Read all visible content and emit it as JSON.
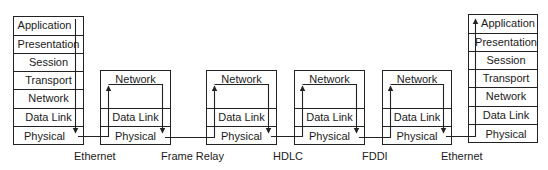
{
  "end_hosts": {
    "left": {
      "layers": [
        "Application",
        "Presentation",
        "Session",
        "Transport",
        "Network",
        "Data Link",
        "Physical"
      ]
    },
    "right": {
      "layers": [
        "Application",
        "Presentation",
        "Session",
        "Transport",
        "Network",
        "Data Link",
        "Physical"
      ]
    }
  },
  "routers": [
    {
      "layers": [
        "Network",
        "Data Link",
        "Physical"
      ]
    },
    {
      "layers": [
        "Network",
        "Data Link",
        "Physical"
      ]
    },
    {
      "layers": [
        "Network",
        "Data Link",
        "Physical"
      ]
    },
    {
      "layers": [
        "Network",
        "Data Link",
        "Physical"
      ]
    }
  ],
  "links": [
    {
      "label": "Ethernet"
    },
    {
      "label": "Frame Relay"
    },
    {
      "label": "HDLC"
    },
    {
      "label": "FDDI"
    },
    {
      "label": "Ethernet"
    }
  ],
  "colors": {
    "line": "#222222",
    "text": "#1a1a1a",
    "background": "#ffffff"
  }
}
